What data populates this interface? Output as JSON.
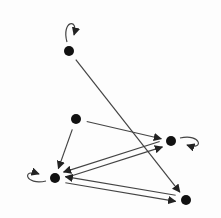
{
  "diagram": {
    "type": "directed-graph",
    "colors": {
      "node": "#111111",
      "edge": "#444444",
      "background": "#fdfdfd"
    },
    "nodes": [
      {
        "id": "A",
        "x": 69,
        "y": 51
      },
      {
        "id": "B",
        "x": 76,
        "y": 119
      },
      {
        "id": "C",
        "x": 171,
        "y": 141
      },
      {
        "id": "D",
        "x": 55,
        "y": 178
      },
      {
        "id": "E",
        "x": 186,
        "y": 200
      }
    ],
    "edges": [
      {
        "from": "A",
        "to": "E"
      },
      {
        "from": "B",
        "to": "C"
      },
      {
        "from": "B",
        "to": "D"
      },
      {
        "from": "C",
        "to": "D"
      },
      {
        "from": "D",
        "to": "C"
      },
      {
        "from": "D",
        "to": "E"
      },
      {
        "from": "E",
        "to": "D"
      }
    ],
    "self_loops": [
      {
        "node": "A",
        "side": "top"
      },
      {
        "node": "C",
        "side": "right"
      },
      {
        "node": "D",
        "side": "left"
      }
    ]
  }
}
